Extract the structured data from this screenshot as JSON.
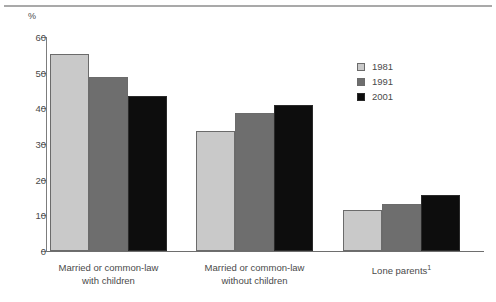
{
  "chart_data": {
    "type": "bar",
    "title": "",
    "subtitle": "",
    "xlabel": "",
    "ylabel": "%",
    "ylim": [
      0,
      60
    ],
    "yticks": [
      0,
      10,
      20,
      30,
      40,
      50,
      60
    ],
    "grid": false,
    "legend_position": "upper-right",
    "categories": [
      "Married or common-law with children",
      "Married or common-law without children",
      "Lone parents¹"
    ],
    "category_lines": [
      [
        "Married or common-law",
        "with children"
      ],
      [
        "Married or common-law",
        "without children"
      ],
      [
        "Lone parents¹",
        ""
      ]
    ],
    "series": [
      {
        "name": "1981",
        "color": "#c9c9c9",
        "values": [
          55.2,
          33.6,
          11.6
        ]
      },
      {
        "name": "1991",
        "color": "#6e6e6e",
        "values": [
          48.7,
          38.6,
          13.3
        ]
      },
      {
        "name": "2001",
        "color": "#0d0d0d",
        "values": [
          43.4,
          40.8,
          15.7
        ]
      }
    ]
  },
  "axis": {
    "unit_label": "%",
    "tick_labels": [
      "60",
      "50",
      "40",
      "30",
      "20",
      "10",
      "0"
    ]
  },
  "legend": {
    "entries": [
      {
        "label": "1981",
        "swatch": "legend-swatch-1981"
      },
      {
        "label": "1991",
        "swatch": "legend-swatch-1991"
      },
      {
        "label": "2001",
        "swatch": "legend-swatch-2001"
      }
    ]
  },
  "colors": {
    "series_1981": "#c9c9c9",
    "series_1991": "#6e6e6e",
    "series_2001": "#0d0d0d",
    "axis": "#7d7d7d",
    "text": "#4a4a4a",
    "rule": "#a9a9a9"
  }
}
